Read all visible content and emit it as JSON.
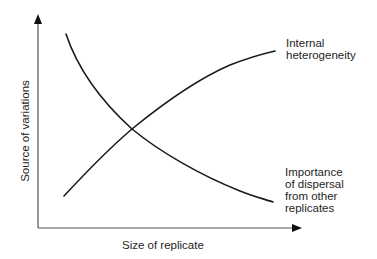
{
  "diagram": {
    "type": "conceptual-line-diagram",
    "x_axis_label": "Size of replicate",
    "y_axis_label": "Source of variations",
    "curves": [
      {
        "name": "Internal heterogeneity",
        "label_lines": [
          "Internal",
          "heterogeneity"
        ],
        "trend": "increasing, concave"
      },
      {
        "name": "Importance of dispersal from other replicates",
        "label_lines": [
          "Importance",
          "of dispersal",
          "from other",
          "replicates"
        ],
        "trend": "decreasing, convex"
      }
    ],
    "line_color": "#1a1a1a",
    "background": "#ffffff"
  }
}
